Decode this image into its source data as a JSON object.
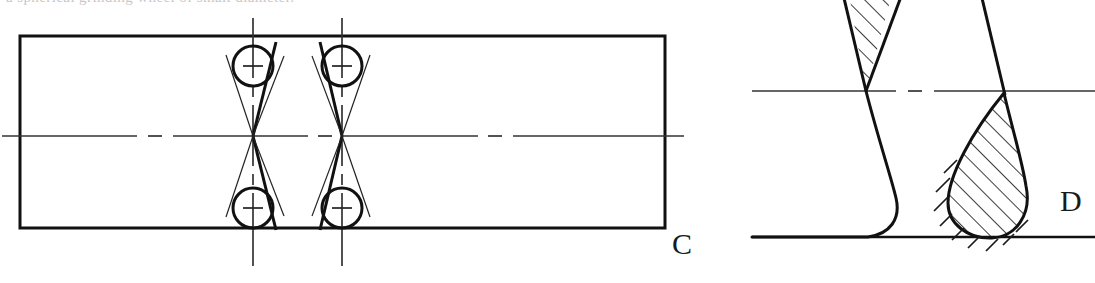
{
  "page": {
    "caption_fragment": "a spherical grinding wheel of small diameter.",
    "background_color": "#ffffff",
    "line_color": "#111111",
    "thin_line_color": "#444444",
    "width": 1095,
    "height": 283
  },
  "figures": [
    {
      "id": "figure-c",
      "label": "C",
      "label_x": 672,
      "label_y": 229,
      "description": "Longitudinal section of a shaft with two circular form-grinding wheels producing hourglass relief grooves",
      "body": {
        "name": "shaft-outline",
        "x": 20,
        "y": 36,
        "width": 645,
        "height": 192,
        "stroke_width": 3
      },
      "center_axis": {
        "name": "horizontal-center-line",
        "y": 136,
        "x_start": 2,
        "x_end": 684,
        "style": "dash-dot",
        "stroke_width": 1.6
      },
      "groove_groups": [
        {
          "name": "groove-group-1",
          "axis_x": 253,
          "axis_y_start": 18,
          "axis_y_end": 266,
          "circle_radius": 20,
          "top_circle_cy": 66,
          "bottom_circle_cy": 208,
          "apex_y": 136,
          "tangent_extend": 12
        },
        {
          "name": "groove-group-2",
          "axis_x": 342,
          "axis_y_start": 18,
          "axis_y_end": 266,
          "circle_radius": 20,
          "top_circle_cy": 66,
          "bottom_circle_cy": 208,
          "apex_y": 136,
          "tangent_extend": 12
        }
      ]
    },
    {
      "id": "figure-d",
      "label": "D",
      "label_x": 1060,
      "label_y": 186,
      "description": "Enlarged detail of the relief groove profile, section hatched, showing the V-form cut and the radiused runout",
      "center_axis": {
        "name": "horizontal-center-line",
        "y": 91,
        "x_start": 752,
        "x_end": 1095,
        "style": "dash-dot",
        "stroke_width": 1.6
      },
      "base_line": {
        "name": "base-line",
        "y": 237,
        "x_start": 752,
        "x_end": 1095,
        "stroke_width": 2.2
      },
      "profiles": [
        {
          "name": "left-groove-profile",
          "apex_x": 866,
          "apex_y": 91,
          "hatched": true,
          "hatch_angle_deg": -45
        },
        {
          "name": "right-groove-teardrop",
          "apex_x": 1004,
          "apex_y": 93,
          "hatched": true,
          "hatch_angle_deg": -45
        }
      ]
    }
  ]
}
